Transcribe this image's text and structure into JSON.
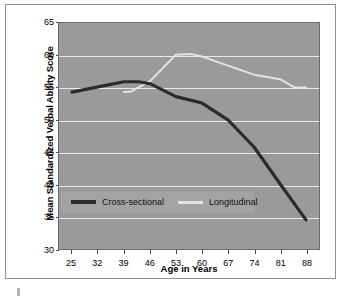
{
  "chart_data": {
    "type": "line",
    "title": "",
    "xlabel": "Age in Years",
    "ylabel": "Mean Standardized Verbal Ability Score",
    "xlim": [
      21.5,
      91.5
    ],
    "ylim": [
      30,
      65
    ],
    "xticks": [
      25,
      32,
      39,
      46,
      53,
      60,
      67,
      74,
      81,
      88
    ],
    "yticks": [
      30,
      35,
      40,
      45,
      50,
      55,
      60,
      65
    ],
    "grid": true,
    "legend_position": "lower-left-inside",
    "series": [
      {
        "name": "Cross-sectional",
        "color": "#2b2b2b",
        "width": 3.2,
        "x": [
          25,
          32,
          39,
          43,
          46,
          53,
          60,
          67,
          74,
          81,
          88
        ],
        "values": [
          54.3,
          55.1,
          55.9,
          55.9,
          55.6,
          53.6,
          52.6,
          50.0,
          45.8,
          40.1,
          34.5
        ]
      },
      {
        "name": "Longitudinal",
        "color": "#e3e3e3",
        "width": 2.0,
        "x": [
          39,
          41,
          46,
          53,
          57,
          60,
          67,
          74,
          81,
          85,
          88
        ],
        "values": [
          54.3,
          54.4,
          56.0,
          60.1,
          60.2,
          59.8,
          58.4,
          57.0,
          56.3,
          55.0,
          55.0
        ]
      }
    ]
  },
  "axes": {
    "y_tick_labels": [
      "65",
      "60",
      "55",
      "50",
      "45",
      "40",
      "35",
      "30"
    ],
    "x_tick_labels": [
      "25",
      "32",
      "39",
      "46",
      "53",
      "60",
      "67",
      "74",
      "81",
      "88"
    ],
    "y_title": "Mean Standardized Verbal Ability Score",
    "x_title": "Age in Years"
  },
  "legend": {
    "items": [
      {
        "label": "Cross-sectional",
        "color": "#2b2b2b"
      },
      {
        "label": "Longitudinal",
        "color": "#e3e3e3"
      }
    ]
  },
  "colors": {
    "plot_background": "#9a9a9a",
    "figure_background": "#ffffff",
    "gridline": "#e9e9e9",
    "legend_background": "#a3a3a3",
    "axis_border": "#6d6d6d",
    "cross_sectional": "#2b2b2b",
    "longitudinal": "#e3e3e3"
  }
}
